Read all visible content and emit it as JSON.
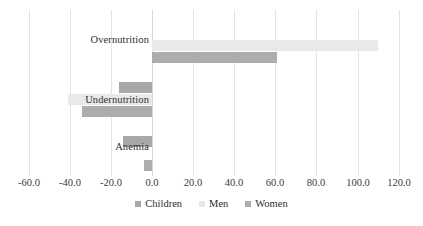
{
  "chart_data": {
    "type": "bar",
    "orientation": "horizontal",
    "title": "",
    "xlabel": "",
    "ylabel": "",
    "categories": [
      "Overnutrition",
      "Undernutrition",
      "Anemia"
    ],
    "series": [
      {
        "name": "Children",
        "color": "#a8a8a8",
        "values": [
          null,
          -16.0,
          -14.0
        ]
      },
      {
        "name": "Men",
        "color": "#e9e9e9",
        "values": [
          110.0,
          -41.0,
          null
        ]
      },
      {
        "name": "Women",
        "color": "#adadad",
        "values": [
          61.0,
          -34.0,
          -4.0
        ]
      }
    ],
    "xlim": [
      -60.0,
      120.0
    ],
    "xticks": [
      -60.0,
      -40.0,
      -20.0,
      0.0,
      20.0,
      40.0,
      60.0,
      80.0,
      100.0,
      120.0
    ],
    "xticklabels": [
      "-60.0",
      "-40.0",
      "-20.0",
      "0.0",
      "20.0",
      "40.0",
      "60.0",
      "80.0",
      "100.0",
      "120.0"
    ],
    "grid": true,
    "grid_axis": "x",
    "legend": [
      "Children",
      "Men",
      "Women"
    ],
    "legend_position": "bottom"
  },
  "axis": {
    "ticks": [
      {
        "label": "-60.0",
        "value": -60.0
      },
      {
        "label": "-40.0",
        "value": -40.0
      },
      {
        "label": "-20.0",
        "value": -20.0
      },
      {
        "label": "0.0",
        "value": 0.0
      },
      {
        "label": "20.0",
        "value": 20.0
      },
      {
        "label": "40.0",
        "value": 40.0
      },
      {
        "label": "60.0",
        "value": 60.0
      },
      {
        "label": "80.0",
        "value": 80.0
      },
      {
        "label": "100.0",
        "value": 100.0
      },
      {
        "label": "120.0",
        "value": 120.0
      }
    ]
  },
  "categories": [
    {
      "label": "Overnutrition"
    },
    {
      "label": "Undernutrition"
    },
    {
      "label": "Anemia"
    }
  ],
  "legend": {
    "entries": [
      {
        "label": "Children",
        "color": "#a8a8a8"
      },
      {
        "label": "Men",
        "color": "#e9e9e9"
      },
      {
        "label": "Women",
        "color": "#adadad"
      }
    ]
  }
}
